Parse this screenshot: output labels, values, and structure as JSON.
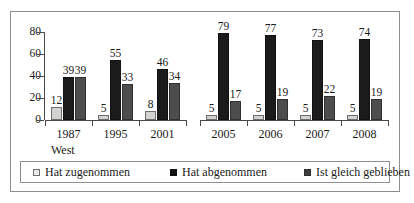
{
  "chart_data": {
    "type": "bar",
    "title": "",
    "subtitle": "",
    "xlabel": "",
    "ylabel": "",
    "ylim": [
      0,
      80
    ],
    "yticks": [
      0,
      20,
      40,
      60,
      80
    ],
    "grid": false,
    "legend_position": "bottom",
    "categories": [
      "1987",
      "1995",
      "2001",
      "2005",
      "2006",
      "2007",
      "2008"
    ],
    "series": [
      {
        "name": "Hat zugenommen",
        "color": "#d4d2cf",
        "values": [
          12,
          5,
          8,
          5,
          5,
          5,
          5
        ]
      },
      {
        "name": "Hat abgenommen",
        "color": "#1b1b1b",
        "values": [
          39,
          55,
          46,
          79,
          77,
          73,
          74
        ]
      },
      {
        "name": "Ist gleich geblieben",
        "color": "#4d4d4d",
        "values": [
          39,
          33,
          34,
          17,
          19,
          22,
          19
        ]
      }
    ],
    "annotations": [
      {
        "text": "West",
        "anchor_category": "1987",
        "position": "below-axis"
      }
    ],
    "axis_breaks": [
      {
        "after_category": "2001",
        "before_category": "2005"
      }
    ]
  },
  "legend": {
    "items": [
      {
        "label": "Hat zugenommen",
        "swatch": "legend-swatch-light"
      },
      {
        "label": "Hat abgenommen",
        "swatch": "legend-swatch-black"
      },
      {
        "label": "Ist gleich geblieben",
        "swatch": "legend-swatch-gray"
      }
    ]
  },
  "axis": {
    "region_label": "West",
    "ytick_labels": [
      "80",
      "60",
      "40",
      "20",
      "0"
    ]
  }
}
